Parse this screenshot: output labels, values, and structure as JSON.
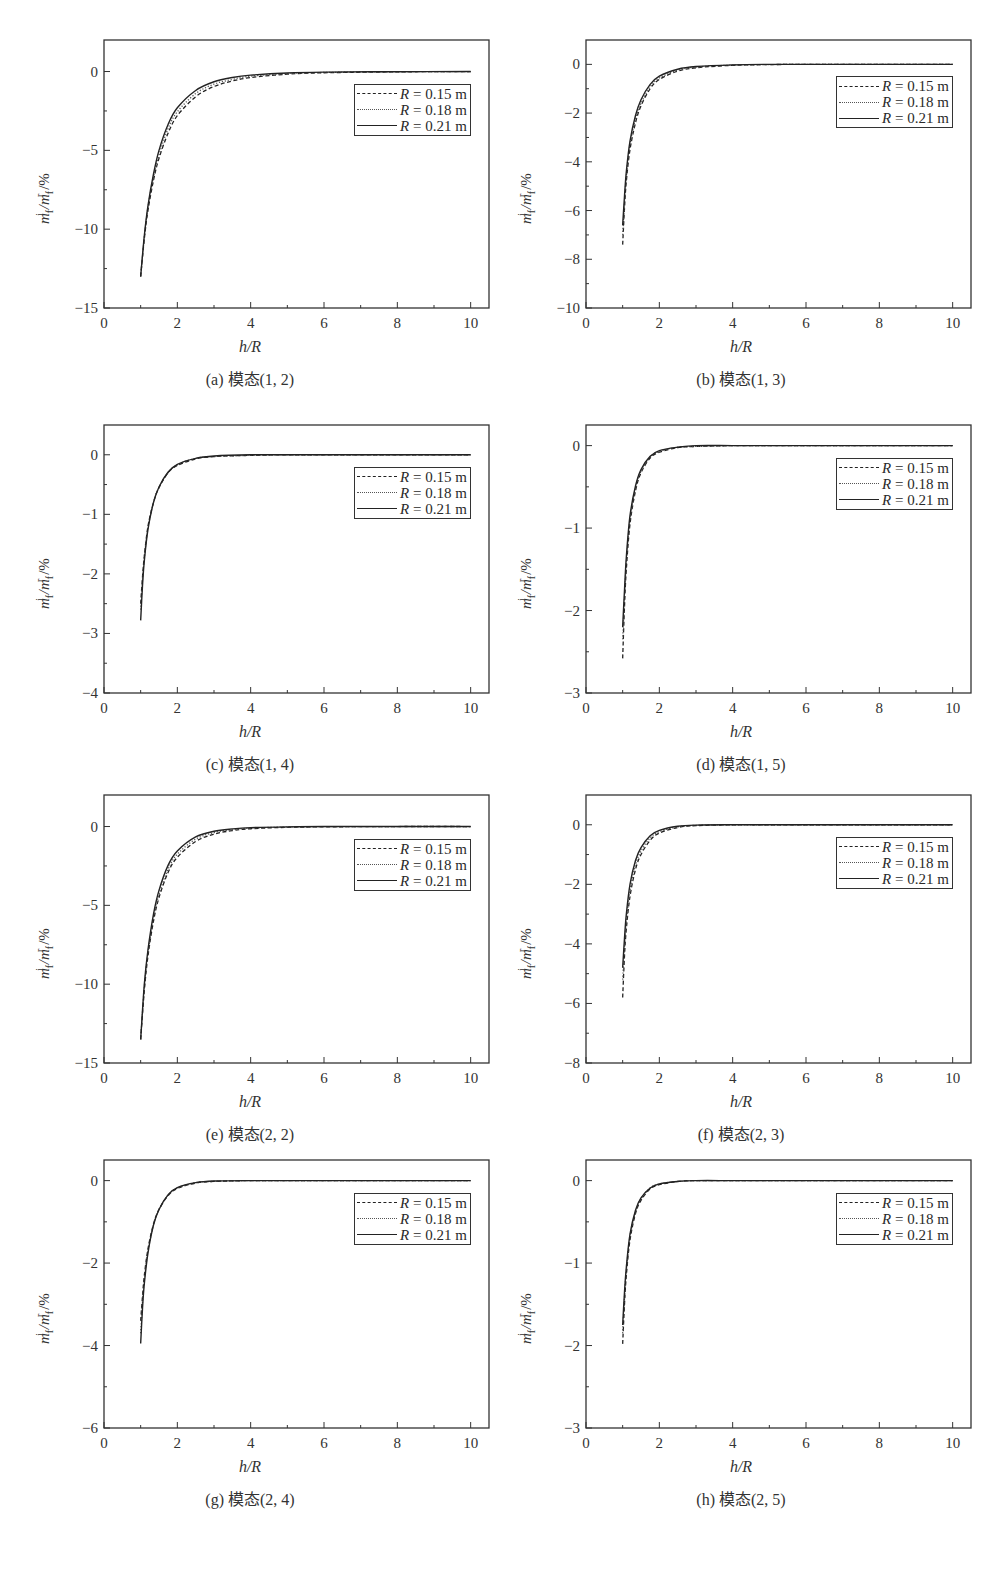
{
  "figure": {
    "y_axis_label": {
      "base": "m",
      "sub1": "f",
      "sup1": "i",
      "sep": " /",
      "base2": "m",
      "sub2": "f",
      "sup2": "r",
      "suffix": " /%"
    },
    "x_axis_label": "h/R",
    "legend": [
      {
        "var": "R",
        "text": " = 0.15 m",
        "style": "dashed"
      },
      {
        "var": "R",
        "text": " = 0.18 m",
        "style": "dotted"
      },
      {
        "var": "R",
        "text": " = 0.21 m",
        "style": "solid"
      }
    ],
    "colors": {
      "axis": "#333333",
      "line": "#222222",
      "background": "#ffffff"
    }
  },
  "chart_data": [
    {
      "id": "a",
      "type": "line",
      "title": "(a) 模态(1, 2)",
      "xlabel": "h/R",
      "ylabel": "m_f^i / m_f^r /%",
      "xlim": [
        0,
        10.5
      ],
      "ylim": [
        -15,
        2
      ],
      "xticks": [
        0,
        2,
        4,
        6,
        8,
        10
      ],
      "yticks": [
        0,
        -5,
        -10,
        -15
      ],
      "grid": false,
      "legend_position": "upper right",
      "x": [
        1.0,
        1.1,
        1.2,
        1.35,
        1.5,
        1.75,
        2.0,
        2.5,
        3.0,
        3.5,
        4.0,
        5.0,
        6.0,
        8.0,
        10.0
      ],
      "series": [
        {
          "name": "R = 0.15 m",
          "style": "dashed",
          "values": [
            -13.0,
            -10.6,
            -8.8,
            -6.9,
            -5.5,
            -3.9,
            -2.8,
            -1.6,
            -0.95,
            -0.6,
            -0.38,
            -0.17,
            -0.08,
            -0.02,
            0.0
          ]
        },
        {
          "name": "R = 0.18 m",
          "style": "dotted",
          "values": [
            -13.0,
            -10.5,
            -8.6,
            -6.7,
            -5.3,
            -3.6,
            -2.55,
            -1.4,
            -0.8,
            -0.5,
            -0.3,
            -0.13,
            -0.06,
            -0.01,
            0.0
          ]
        },
        {
          "name": "R = 0.21 m",
          "style": "solid",
          "values": [
            -13.0,
            -10.4,
            -8.5,
            -6.5,
            -5.0,
            -3.35,
            -2.3,
            -1.2,
            -0.65,
            -0.38,
            -0.23,
            -0.09,
            -0.04,
            -0.01,
            0.0
          ]
        }
      ]
    },
    {
      "id": "b",
      "type": "line",
      "title": "(b) 模态(1, 3)",
      "xlabel": "h/R",
      "ylabel": "m_f^i / m_f^r /%",
      "xlim": [
        0,
        10.5
      ],
      "ylim": [
        -10,
        1
      ],
      "xticks": [
        0,
        2,
        4,
        6,
        8,
        10
      ],
      "yticks": [
        0,
        -2,
        -4,
        -6,
        -8,
        -10
      ],
      "grid": false,
      "legend_position": "upper right",
      "x": [
        1.0,
        1.05,
        1.1,
        1.2,
        1.35,
        1.5,
        1.75,
        2.0,
        2.5,
        3.0,
        4.0,
        5.0,
        6.0,
        8.0,
        10.0
      ],
      "series": [
        {
          "name": "R = 0.15 m",
          "style": "dashed",
          "values": [
            -7.4,
            -5.9,
            -4.8,
            -3.5,
            -2.4,
            -1.7,
            -1.0,
            -0.62,
            -0.28,
            -0.14,
            -0.04,
            -0.01,
            0.0,
            0.0,
            0.0
          ]
        },
        {
          "name": "R = 0.18 m",
          "style": "dotted",
          "values": [
            -7.0,
            -5.7,
            -4.6,
            -3.3,
            -2.25,
            -1.6,
            -0.92,
            -0.56,
            -0.24,
            -0.11,
            -0.03,
            -0.01,
            0.0,
            0.0,
            0.0
          ]
        },
        {
          "name": "R = 0.21 m",
          "style": "solid",
          "values": [
            -6.6,
            -5.4,
            -4.4,
            -3.15,
            -2.1,
            -1.45,
            -0.82,
            -0.48,
            -0.2,
            -0.09,
            -0.02,
            0.0,
            0.0,
            0.0,
            0.0
          ]
        }
      ]
    },
    {
      "id": "c",
      "type": "line",
      "title": "(c) 模态(1, 4)",
      "xlabel": "h/R",
      "ylabel": "m_f^i / m_f^r /%",
      "xlim": [
        0,
        10.5
      ],
      "ylim": [
        -4,
        0.5
      ],
      "xticks": [
        0,
        2,
        4,
        6,
        8,
        10
      ],
      "yticks": [
        0,
        -1,
        -2,
        -3,
        -4
      ],
      "grid": false,
      "legend_position": "upper right",
      "x": [
        1.0,
        1.05,
        1.1,
        1.2,
        1.35,
        1.5,
        1.75,
        2.0,
        2.5,
        3.0,
        4.0,
        5.0,
        6.0,
        8.0,
        10.0
      ],
      "series": [
        {
          "name": "R = 0.15 m",
          "style": "dashed",
          "values": [
            -2.5,
            -2.05,
            -1.7,
            -1.2,
            -0.8,
            -0.55,
            -0.3,
            -0.18,
            -0.07,
            -0.03,
            -0.01,
            0.0,
            0.0,
            0.0,
            0.0
          ]
        },
        {
          "name": "R = 0.18 m",
          "style": "dotted",
          "values": [
            -2.6,
            -2.1,
            -1.72,
            -1.22,
            -0.8,
            -0.55,
            -0.3,
            -0.17,
            -0.06,
            -0.03,
            -0.01,
            0.0,
            0.0,
            0.0,
            0.0
          ]
        },
        {
          "name": "R = 0.21 m",
          "style": "solid",
          "values": [
            -2.78,
            -2.2,
            -1.78,
            -1.25,
            -0.8,
            -0.54,
            -0.29,
            -0.16,
            -0.06,
            -0.02,
            0.0,
            0.0,
            0.0,
            0.0,
            0.0
          ]
        }
      ]
    },
    {
      "id": "d",
      "type": "line",
      "title": "(d) 模态(1, 5)",
      "xlabel": "h/R",
      "ylabel": "m_f^i / m_f^r /%",
      "xlim": [
        0,
        10.5
      ],
      "ylim": [
        -3,
        0.25
      ],
      "xticks": [
        0,
        2,
        4,
        6,
        8,
        10
      ],
      "yticks": [
        0,
        -1,
        -2,
        -3
      ],
      "grid": false,
      "legend_position": "upper right",
      "x": [
        1.0,
        1.05,
        1.1,
        1.2,
        1.35,
        1.5,
        1.75,
        2.0,
        2.5,
        3.0,
        4.0,
        5.0,
        6.0,
        8.0,
        10.0
      ],
      "series": [
        {
          "name": "R = 0.15 m",
          "style": "dashed",
          "values": [
            -2.58,
            -1.95,
            -1.5,
            -0.95,
            -0.55,
            -0.33,
            -0.15,
            -0.08,
            -0.025,
            -0.01,
            0.0,
            0.0,
            0.0,
            0.0,
            0.0
          ]
        },
        {
          "name": "R = 0.18 m",
          "style": "dotted",
          "values": [
            -2.35,
            -1.85,
            -1.42,
            -0.9,
            -0.52,
            -0.31,
            -0.14,
            -0.07,
            -0.02,
            -0.01,
            0.0,
            0.0,
            0.0,
            0.0,
            0.0
          ]
        },
        {
          "name": "R = 0.21 m",
          "style": "solid",
          "values": [
            -2.2,
            -1.75,
            -1.35,
            -0.85,
            -0.49,
            -0.29,
            -0.13,
            -0.06,
            -0.02,
            0.0,
            0.0,
            0.0,
            0.0,
            0.0,
            0.0
          ]
        }
      ]
    },
    {
      "id": "e",
      "type": "line",
      "title": "(e) 模态(2, 2)",
      "xlabel": "h/R",
      "ylabel": "m_f^i / m_f^r /%",
      "xlim": [
        0,
        10.5
      ],
      "ylim": [
        -15,
        2
      ],
      "xticks": [
        0,
        2,
        4,
        6,
        8,
        10
      ],
      "yticks": [
        0,
        -5,
        -10,
        -15
      ],
      "grid": false,
      "legend_position": "upper right",
      "x": [
        1.0,
        1.1,
        1.2,
        1.35,
        1.5,
        1.75,
        2.0,
        2.5,
        3.0,
        3.5,
        4.0,
        5.0,
        6.0,
        8.0,
        10.0
      ],
      "series": [
        {
          "name": "R = 0.15 m",
          "style": "dashed",
          "values": [
            -13.5,
            -10.4,
            -8.2,
            -6.0,
            -4.5,
            -2.9,
            -1.95,
            -0.95,
            -0.48,
            -0.26,
            -0.14,
            -0.05,
            -0.02,
            0.0,
            0.0
          ]
        },
        {
          "name": "R = 0.18 m",
          "style": "dotted",
          "values": [
            -13.5,
            -10.2,
            -8.0,
            -5.8,
            -4.3,
            -2.7,
            -1.75,
            -0.8,
            -0.38,
            -0.2,
            -0.1,
            -0.03,
            -0.01,
            0.0,
            0.0
          ]
        },
        {
          "name": "R = 0.21 m",
          "style": "solid",
          "values": [
            -13.5,
            -10.0,
            -7.8,
            -5.55,
            -4.05,
            -2.45,
            -1.55,
            -0.66,
            -0.3,
            -0.15,
            -0.07,
            -0.02,
            0.0,
            0.0,
            0.0
          ]
        }
      ]
    },
    {
      "id": "f",
      "type": "line",
      "title": "(f) 模态(2, 3)",
      "xlabel": "h/R",
      "ylabel": "m_f^i / m_f^r /%",
      "xlim": [
        0,
        10.5
      ],
      "ylim": [
        -8,
        1
      ],
      "xticks": [
        0,
        2,
        4,
        6,
        8,
        10
      ],
      "yticks": [
        0,
        -2,
        -4,
        -6,
        -8
      ],
      "grid": false,
      "legend_position": "upper right",
      "x": [
        1.0,
        1.05,
        1.1,
        1.2,
        1.35,
        1.5,
        1.75,
        2.0,
        2.5,
        3.0,
        4.0,
        5.0,
        6.0,
        8.0,
        10.0
      ],
      "series": [
        {
          "name": "R = 0.15 m",
          "style": "dashed",
          "values": [
            -5.8,
            -4.4,
            -3.5,
            -2.4,
            -1.5,
            -1.0,
            -0.52,
            -0.28,
            -0.09,
            -0.03,
            0.0,
            0.0,
            0.0,
            0.0,
            0.0
          ]
        },
        {
          "name": "R = 0.18 m",
          "style": "dotted",
          "values": [
            -5.2,
            -4.1,
            -3.25,
            -2.2,
            -1.35,
            -0.88,
            -0.44,
            -0.23,
            -0.07,
            -0.02,
            0.0,
            0.0,
            0.0,
            0.0,
            0.0
          ]
        },
        {
          "name": "R = 0.21 m",
          "style": "solid",
          "values": [
            -4.8,
            -3.8,
            -3.0,
            -2.0,
            -1.2,
            -0.77,
            -0.37,
            -0.19,
            -0.05,
            -0.01,
            0.0,
            0.0,
            0.0,
            0.0,
            0.0
          ]
        }
      ]
    },
    {
      "id": "g",
      "type": "line",
      "title": "(g) 模态(2, 4)",
      "xlabel": "h/R",
      "ylabel": "m_f^i / m_f^r /%",
      "xlim": [
        0,
        10.5
      ],
      "ylim": [
        -6,
        0.5
      ],
      "xticks": [
        0,
        2,
        4,
        6,
        8,
        10
      ],
      "yticks": [
        0,
        -2,
        -4,
        -6
      ],
      "grid": false,
      "legend_position": "upper right",
      "x": [
        1.0,
        1.05,
        1.1,
        1.2,
        1.35,
        1.5,
        1.75,
        2.0,
        2.5,
        3.0,
        4.0,
        5.0,
        6.0,
        8.0,
        10.0
      ],
      "series": [
        {
          "name": "R = 0.15 m",
          "style": "dashed",
          "values": [
            -3.4,
            -2.8,
            -2.3,
            -1.65,
            -1.05,
            -0.7,
            -0.36,
            -0.19,
            -0.06,
            -0.02,
            0.0,
            0.0,
            0.0,
            0.0,
            0.0
          ]
        },
        {
          "name": "R = 0.18 m",
          "style": "dotted",
          "values": [
            -3.7,
            -2.95,
            -2.4,
            -1.7,
            -1.07,
            -0.7,
            -0.35,
            -0.18,
            -0.05,
            -0.02,
            0.0,
            0.0,
            0.0,
            0.0,
            0.0
          ]
        },
        {
          "name": "R = 0.21 m",
          "style": "solid",
          "values": [
            -3.95,
            -3.1,
            -2.5,
            -1.75,
            -1.08,
            -0.7,
            -0.34,
            -0.17,
            -0.05,
            -0.01,
            0.0,
            0.0,
            0.0,
            0.0,
            0.0
          ]
        }
      ]
    },
    {
      "id": "h",
      "type": "line",
      "title": "(h) 模态(2, 5)",
      "xlabel": "h/R",
      "ylabel": "m_f^i / m_f^r /%",
      "xlim": [
        0,
        10.5
      ],
      "ylim": [
        -3,
        0.25
      ],
      "xticks": [
        0,
        2,
        4,
        6,
        8,
        10
      ],
      "yticks": [
        0,
        -1,
        -2,
        -3
      ],
      "grid": false,
      "legend_position": "upper right",
      "x": [
        1.0,
        1.05,
        1.1,
        1.2,
        1.35,
        1.5,
        1.75,
        2.0,
        2.5,
        3.0,
        4.0,
        5.0,
        6.0,
        8.0,
        10.0
      ],
      "series": [
        {
          "name": "R = 0.15 m",
          "style": "dashed",
          "values": [
            -1.98,
            -1.5,
            -1.15,
            -0.72,
            -0.4,
            -0.24,
            -0.1,
            -0.05,
            -0.01,
            0.0,
            0.0,
            0.0,
            0.0,
            0.0,
            0.0
          ]
        },
        {
          "name": "R = 0.18 m",
          "style": "dotted",
          "values": [
            -1.85,
            -1.42,
            -1.1,
            -0.68,
            -0.38,
            -0.22,
            -0.09,
            -0.04,
            -0.01,
            0.0,
            0.0,
            0.0,
            0.0,
            0.0,
            0.0
          ]
        },
        {
          "name": "R = 0.21 m",
          "style": "solid",
          "values": [
            -1.75,
            -1.35,
            -1.05,
            -0.65,
            -0.36,
            -0.21,
            -0.09,
            -0.04,
            -0.01,
            0.0,
            0.0,
            0.0,
            0.0,
            0.0,
            0.0
          ]
        }
      ]
    }
  ]
}
